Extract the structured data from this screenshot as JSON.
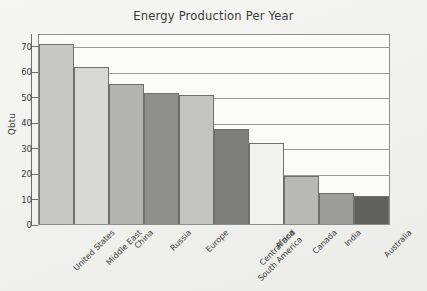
{
  "chart_data": {
    "type": "bar",
    "title": "Energy Production Per Year",
    "xlabel": "",
    "ylabel": "Qbtu",
    "categories": [
      "United States",
      "Middle East",
      "China",
      "Russia",
      "Europe",
      "Central and\nSouth America",
      "Africa",
      "Canada",
      "India",
      "Australia"
    ],
    "values": [
      70.5,
      61.5,
      55,
      51.5,
      50.5,
      37.5,
      32,
      19,
      12,
      11
    ],
    "bar_colors": [
      "#c8c8c6",
      "#d8d8d6",
      "#b3b3b1",
      "#8f8f8d",
      "#c4c4c2",
      "#7e7e7c",
      "#f2f2f0",
      "#b8b8b6",
      "#9d9d9b",
      "#616160"
    ],
    "ylim": [
      0,
      75
    ],
    "yticks": [
      0,
      10,
      20,
      30,
      40,
      50,
      60,
      70
    ],
    "ytick_labels": [
      "0",
      "10",
      "20",
      "30",
      "40",
      "50",
      "60",
      "70"
    ],
    "grid": true,
    "legend": false,
    "legend_position": "none",
    "frame_color": "#8d8d8d",
    "bar_edge_color": "#6f6f6f",
    "plot_background": "#fbfbfa",
    "figure_background": "#f2f2f0",
    "text_color": "#3a3a3a"
  }
}
